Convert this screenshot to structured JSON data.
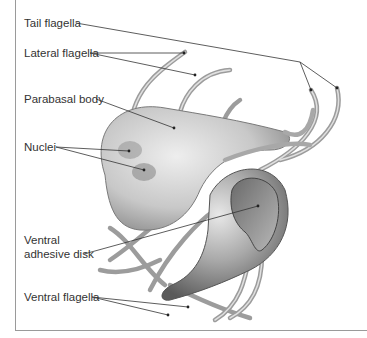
{
  "figure": {
    "labels": {
      "tail_flagella": "Tail flagella",
      "lateral_flagella": "Lateral flagella",
      "parabasal_body": "Parabasal body",
      "nuclei": "Nuclei",
      "ventral_adhesive_disk_line1": "Ventral",
      "ventral_adhesive_disk_line2": "adhesive disk",
      "ventral_flagella": "Ventral flagella"
    },
    "colors": {
      "leader_line": "#333333",
      "cell_light": "#d8d8d8",
      "cell_dark": "#7a7a7a",
      "flagella": "#b0b0b0",
      "frame": "#9a9a9a"
    }
  }
}
